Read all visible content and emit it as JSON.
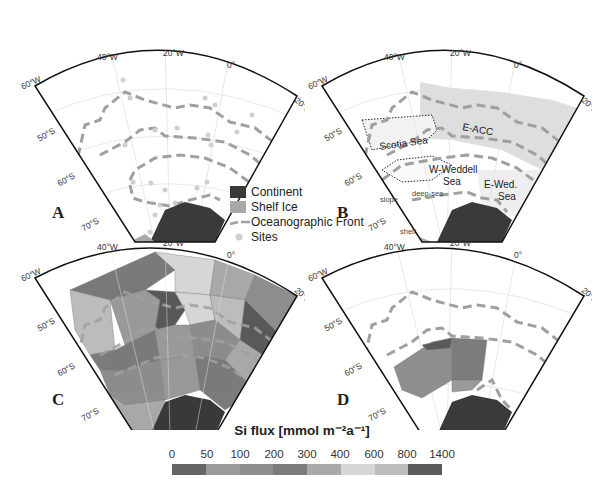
{
  "panels": [
    {
      "id": "A",
      "label": "A"
    },
    {
      "id": "B",
      "label": "B",
      "regions": [
        "E-ACC",
        "Scotia Sea",
        "W-Weddell",
        "Sea",
        "E-Wed.",
        "Sea",
        "deep-sea",
        "slope",
        "shelf"
      ]
    },
    {
      "id": "C",
      "label": "C"
    },
    {
      "id": "D",
      "label": "D"
    }
  ],
  "axes": {
    "lon_labels": [
      "60°W",
      "40°W",
      "20°W",
      "0°",
      "20°E"
    ],
    "lat_labels": [
      "50°S",
      "60°S",
      "70°S"
    ]
  },
  "legend": {
    "items": [
      {
        "label": "Continent",
        "color": "#3a3a3a",
        "type": "box"
      },
      {
        "label": "Shelf Ice",
        "color": "#a8a8a8",
        "type": "box"
      },
      {
        "label": "Oceanographic Front",
        "color": "#a0a0a0",
        "type": "dash"
      },
      {
        "label": "Sites",
        "color": "#cfcfcf",
        "type": "dot"
      }
    ]
  },
  "colorbar": {
    "title": "Si flux [mmol m⁻²a⁻¹]",
    "ticks": [
      "0",
      "50",
      "100",
      "200",
      "300",
      "400",
      "600",
      "800",
      "1400"
    ],
    "colors": [
      "#666666",
      "#9a9a9a",
      "#8e8e8e",
      "#7c7c7c",
      "#a9a9a9",
      "#d6d6d6",
      "#bdbdbd",
      "#5a5a5a"
    ]
  },
  "chart_data": {
    "type": "heatmap",
    "panels": [
      "A: sites and oceanographic fronts",
      "B: regions (E-ACC, Scotia Sea, W-Weddell Sea, E-Wed. Sea, deep-sea, slope, shelf)",
      "C: Si flux polygons (full area)",
      "D: Si flux polygons (Weddell Sea subset)"
    ],
    "colorbar_bins": [
      [
        0,
        50
      ],
      [
        50,
        100
      ],
      [
        100,
        200
      ],
      [
        200,
        300
      ],
      [
        300,
        400
      ],
      [
        400,
        600
      ],
      [
        600,
        800
      ],
      [
        800,
        1400
      ]
    ],
    "xlabel": "Longitude (60°W – 20°E)",
    "ylabel": "Latitude (50°S – 70°S)",
    "legend": [
      "Continent",
      "Shelf Ice",
      "Oceanographic Front",
      "Sites"
    ]
  }
}
